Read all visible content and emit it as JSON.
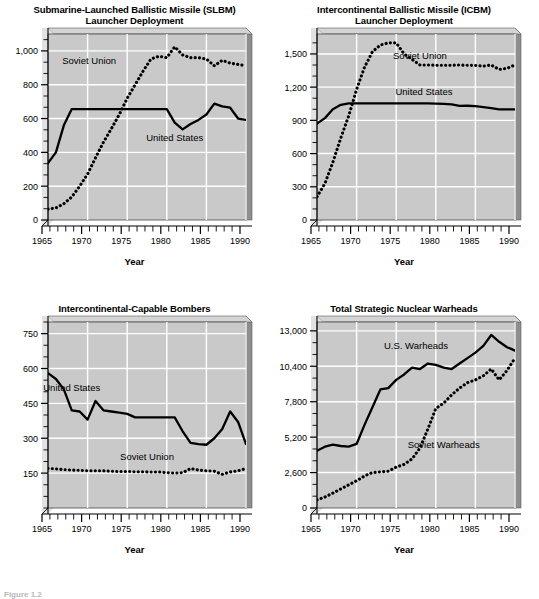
{
  "page": {
    "caption": "Figure 1.2"
  },
  "panels": [
    {
      "id": "slbm",
      "title": "Submarine-Launched Ballistic Missile (SLBM)\nLauncher Deployment",
      "xlabel": "Year",
      "yticklabels": [
        "0",
        "200",
        "400",
        "600",
        "800",
        "1,000"
      ],
      "yticks": [
        0,
        200,
        400,
        600,
        800,
        1000
      ],
      "xticklabels": [
        "1965",
        "1970",
        "1975",
        "1980",
        "1985",
        "1990"
      ],
      "xticks": [
        1965,
        1970,
        1975,
        1980,
        1985,
        1990
      ],
      "series_labels": [
        {
          "name": "Soviet Union",
          "x": 1970.2,
          "y": 925
        },
        {
          "name": "United States",
          "x": 1981.0,
          "y": 470
        }
      ],
      "chart_data": {
        "type": "line",
        "title": "Submarine-Launched Ballistic Missile (SLBM) Launcher Deployment",
        "xlabel": "Year",
        "ylabel": "",
        "xlim": [
          1965,
          1990
        ],
        "ylim": [
          0,
          1100
        ],
        "grid": true,
        "legend": "inline-annotation",
        "x": [
          1965,
          1966,
          1967,
          1968,
          1969,
          1970,
          1971,
          1972,
          1973,
          1974,
          1975,
          1976,
          1977,
          1978,
          1979,
          1980,
          1981,
          1982,
          1983,
          1984,
          1985,
          1986,
          1987,
          1988,
          1989,
          1990
        ],
        "series": [
          {
            "name": "United States",
            "style": "solid",
            "values": [
              336,
              400,
              560,
              656,
              656,
              656,
              656,
              656,
              656,
              656,
              656,
              656,
              656,
              656,
              656,
              656,
              576,
              536,
              568,
              592,
              624,
              688,
              672,
              664,
              600,
              592,
              616
            ]
          },
          {
            "name": "Soviet Union",
            "style": "dotted",
            "values": [
              64,
              72,
              96,
              136,
              200,
              272,
              368,
              460,
              540,
              624,
              720,
              800,
              880,
              952,
              968,
              960,
              1024,
              976,
              960,
              960,
              952,
              912,
              944,
              928,
              920,
              912
            ]
          }
        ]
      }
    },
    {
      "id": "icbm",
      "title": "Intercontinental Ballistic Missile (ICBM)\nLauncher Deployment",
      "xlabel": "Year",
      "yticklabels": [
        "0",
        "300",
        "600",
        "900",
        "1,200",
        "1,500"
      ],
      "yticks": [
        0,
        300,
        600,
        900,
        1200,
        1500
      ],
      "xticklabels": [
        "1965",
        "1970",
        "1975",
        "1980",
        "1985",
        "1990"
      ],
      "xticks": [
        1965,
        1970,
        1975,
        1980,
        1985,
        1990
      ],
      "series_labels": [
        {
          "name": "Soviet Union",
          "x": 1978.0,
          "y": 1455
        },
        {
          "name": "United States",
          "x": 1978.5,
          "y": 1130
        }
      ],
      "chart_data": {
        "type": "line",
        "title": "Intercontinental Ballistic Missile (ICBM) Launcher Deployment",
        "xlabel": "Year",
        "ylabel": "",
        "xlim": [
          1965,
          1990
        ],
        "ylim": [
          0,
          1680
        ],
        "grid": true,
        "legend": "inline-annotation",
        "x": [
          1965,
          1966,
          1967,
          1968,
          1969,
          1970,
          1971,
          1972,
          1973,
          1974,
          1975,
          1976,
          1977,
          1978,
          1979,
          1980,
          1981,
          1982,
          1983,
          1984,
          1985,
          1986,
          1987,
          1988,
          1989,
          1990
        ],
        "series": [
          {
            "name": "United States",
            "style": "solid",
            "values": [
              870,
              920,
              1000,
              1040,
              1054,
              1054,
              1054,
              1054,
              1054,
              1054,
              1054,
              1054,
              1054,
              1054,
              1054,
              1052,
              1048,
              1045,
              1030,
              1032,
              1028,
              1020,
              1010,
              1000,
              1000,
              1000
            ]
          },
          {
            "name": "Soviet Union",
            "style": "dotted",
            "values": [
              210,
              330,
              520,
              740,
              940,
              1180,
              1380,
              1520,
              1580,
              1600,
              1600,
              1500,
              1450,
              1400,
              1400,
              1398,
              1398,
              1398,
              1400,
              1398,
              1396,
              1390,
              1400,
              1360,
              1370,
              1400
            ]
          }
        ]
      }
    },
    {
      "id": "bombers",
      "title": "Intercontinental-Capable Bombers",
      "xlabel": "Year",
      "yticklabels": [
        "150",
        "300",
        "450",
        "600",
        "750"
      ],
      "yticks": [
        150,
        300,
        450,
        600,
        750
      ],
      "xticklabels": [
        "1965",
        "1970",
        "1975",
        "1980",
        "1985",
        "1990"
      ],
      "xticks": [
        1965,
        1970,
        1975,
        1980,
        1985,
        1990
      ],
      "series_labels": [
        {
          "name": "United States",
          "x": 1968.0,
          "y": 505
        },
        {
          "name": "Soviet Union",
          "x": 1977.5,
          "y": 205
        }
      ],
      "chart_data": {
        "type": "line",
        "title": "Intercontinental-Capable Bombers",
        "xlabel": "Year",
        "ylabel": "",
        "xlim": [
          1965,
          1990
        ],
        "ylim": [
          0,
          800
        ],
        "grid": true,
        "legend": "inline-annotation",
        "x": [
          1965,
          1966,
          1967,
          1968,
          1969,
          1970,
          1971,
          1972,
          1973,
          1974,
          1975,
          1976,
          1977,
          1978,
          1979,
          1980,
          1981,
          1982,
          1983,
          1984,
          1985,
          1986,
          1987,
          1988,
          1989,
          1990
        ],
        "series": [
          {
            "name": "United States",
            "style": "solid",
            "values": [
              580,
              555,
              510,
              420,
              415,
              380,
              460,
              420,
              415,
              410,
              405,
              390,
              390,
              390,
              390,
              390,
              390,
              330,
              280,
              275,
              272,
              300,
              340,
              415,
              370,
              275
            ]
          },
          {
            "name": "Soviet Union",
            "style": "dotted",
            "values": [
              170,
              168,
              165,
              163,
              162,
              160,
              160,
              160,
              158,
              157,
              157,
              156,
              156,
              155,
              155,
              152,
              150,
              152,
              170,
              163,
              160,
              158,
              145,
              155,
              160,
              170
            ]
          }
        ]
      }
    },
    {
      "id": "warheads",
      "title": "Total Strategic Nuclear Warheads",
      "xlabel": "Year",
      "yticklabels": [
        "0",
        "2,600",
        "5,200",
        "7,800",
        "10,400",
        "13,000"
      ],
      "yticks": [
        0,
        2600,
        5200,
        7800,
        10400,
        13000
      ],
      "xticklabels": [
        "1965",
        "1970",
        "1975",
        "1980",
        "1985",
        "1990"
      ],
      "xticklabels_alt": [
        "1965",
        "1970",
        "1975",
        "1980",
        "1985",
        "1990"
      ],
      "xticks": [
        1965,
        1970,
        1975,
        1980,
        1985,
        1990
      ],
      "series_labels": [
        {
          "name": "U.S. Warheads",
          "x": 1977.5,
          "y": 11700
        },
        {
          "name": "Soviet Warheads",
          "x": 1981.0,
          "y": 4400
        }
      ],
      "chart_data": {
        "type": "line",
        "title": "Total Strategic Nuclear Warheads",
        "xlabel": "Year",
        "ylabel": "",
        "xlim": [
          1965,
          1990
        ],
        "ylim": [
          0,
          13650
        ],
        "grid": true,
        "legend": "inline-annotation",
        "x": [
          1965,
          1966,
          1967,
          1968,
          1969,
          1970,
          1971,
          1972,
          1973,
          1974,
          1975,
          1976,
          1977,
          1978,
          1979,
          1980,
          1981,
          1982,
          1983,
          1984,
          1985,
          1986,
          1987,
          1988,
          1989,
          1990
        ],
        "series": [
          {
            "name": "U.S. Warheads",
            "style": "solid",
            "values": [
              4200,
              4500,
              4650,
              4550,
              4500,
              4700,
              6100,
              7400,
              8700,
              8800,
              9400,
              9800,
              10300,
              10200,
              10600,
              10500,
              10300,
              10200,
              10600,
              11000,
              11400,
              11900,
              12700,
              12200,
              11800,
              11550
            ]
          },
          {
            "name": "Soviet Warheads",
            "style": "dotted",
            "values": [
              600,
              800,
              1100,
              1400,
              1700,
              2000,
              2350,
              2600,
              2650,
              2700,
              3000,
              3200,
              3600,
              4400,
              5800,
              7300,
              7700,
              8300,
              8800,
              9200,
              9400,
              9700,
              10200,
              9400,
              10100,
              11000
            ]
          }
        ]
      }
    }
  ]
}
